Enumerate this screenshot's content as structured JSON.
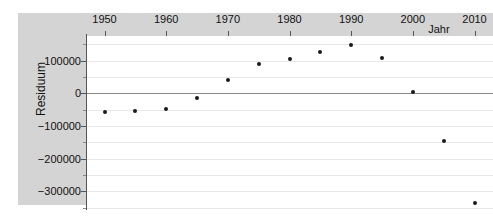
{
  "chart_data": {
    "type": "scatter",
    "title": "",
    "subtitle": "",
    "xlabel": "Jahr",
    "ylabel": "Residuum",
    "x": [
      1950,
      1955,
      1960,
      1965,
      1970,
      1975,
      1980,
      1985,
      1990,
      1995,
      2000,
      2005,
      2010
    ],
    "values": [
      -57000,
      -55000,
      -47000,
      -14000,
      41000,
      88000,
      106000,
      126000,
      146000,
      107000,
      5000,
      -145000,
      -337000
    ],
    "series": [
      {
        "name": "Residuum",
        "values": [
          -57000,
          -55000,
          -47000,
          -14000,
          41000,
          88000,
          106000,
          126000,
          146000,
          107000,
          5000,
          -145000,
          -337000
        ]
      }
    ],
    "xlim": [
      1947,
      2013
    ],
    "ylim": [
      -360000,
      175000
    ],
    "xticks": [
      1950,
      1960,
      1970,
      1980,
      1990,
      2000,
      2010
    ],
    "xtick_labels": [
      "1950",
      "1960",
      "1970",
      "1980",
      "1990",
      "2000",
      "2010"
    ],
    "yticks": [
      100000,
      0,
      -100000,
      -200000,
      -300000
    ],
    "ytick_labels": [
      "100000",
      "0",
      "-100000",
      "-200000",
      "-300000"
    ],
    "yticks_minor": [
      150000,
      50000,
      -50000,
      -150000,
      -250000,
      -350000
    ],
    "grid": true,
    "grid_axis": "y",
    "legend": "none",
    "xaxis_position": "top",
    "point_color": "#1a1a1a",
    "panel_color": "#d4d4d4",
    "plot_background": "#ffffff",
    "gridline_color": "#e8e8e8",
    "zero_line_color": "#8a8a8a"
  }
}
